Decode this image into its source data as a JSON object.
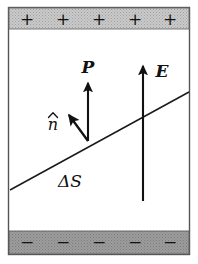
{
  "figure": {
    "background_color": "#ffffff",
    "line_color": "#1a1a1a",
    "frame": {
      "x": 8,
      "y": 7,
      "width": 182,
      "height": 248,
      "border_color": "#4d4d4d",
      "fill_color": "#ffffff"
    },
    "top_band": {
      "name": "positive-charge-band",
      "fill_color": "#c9c9c9",
      "hatch_color": "#9a9a9a",
      "x": 9,
      "y": 8,
      "width": 180,
      "height": 21,
      "charge_symbol": "+",
      "charge_count": 5,
      "symbol_color": "#555555",
      "symbols": [
        "+",
        "+",
        "+",
        "+",
        "+"
      ]
    },
    "bottom_band": {
      "name": "negative-charge-band",
      "fill_color": "#9b9b9b",
      "hatch_color": "#787878",
      "x": 9,
      "y": 231,
      "width": 180,
      "height": 23,
      "charge_symbol": "−",
      "charge_count": 5,
      "symbol_color": "#3a3a3a",
      "symbols": [
        "−",
        "−",
        "−",
        "−",
        "−"
      ]
    },
    "surface_line": {
      "name": "delta-s-surface",
      "x1": 10,
      "y1": 190,
      "x2": 189,
      "y2": 92,
      "stroke_width": 1.5
    },
    "vectors": [
      {
        "name": "polarization-vector-P",
        "label": "P",
        "label_style": "bold-italic",
        "label_x": 88,
        "label_y": 72,
        "x1": 88,
        "y1": 141,
        "x2": 88,
        "y2": 80,
        "stroke_width": 2.2
      },
      {
        "name": "electric-field-vector-E",
        "label": "E",
        "label_style": "bold-italic",
        "label_x": 160,
        "label_y": 76,
        "x1": 143,
        "y1": 201,
        "x2": 143,
        "y2": 63,
        "stroke_width": 2.2
      },
      {
        "name": "unit-normal-vector-n-hat",
        "label": "n̂",
        "label_plain": "n",
        "label_style": "italic-with-hat",
        "label_x": 52,
        "label_y": 127,
        "x1": 88,
        "y1": 141,
        "x2": 66,
        "y2": 111,
        "stroke_width": 2.2
      }
    ],
    "area_label": {
      "name": "delta-s-label",
      "text": "ΔS",
      "x": 70,
      "y": 186,
      "style": "italic"
    }
  }
}
